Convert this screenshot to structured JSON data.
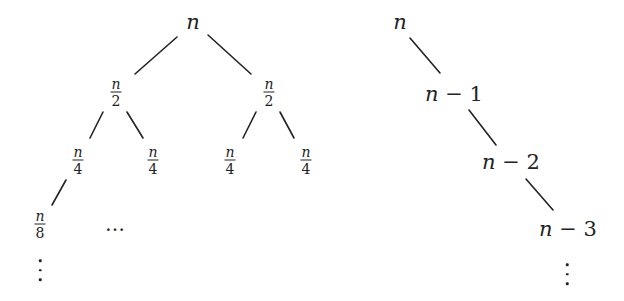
{
  "left_tree": {
    "root": {
      "label": "n"
    },
    "level1": [
      {
        "num": "n",
        "den": "2"
      },
      {
        "num": "n",
        "den": "2"
      }
    ],
    "level2": [
      {
        "num": "n",
        "den": "4"
      },
      {
        "num": "n",
        "den": "4"
      },
      {
        "num": "n",
        "den": "4"
      },
      {
        "num": "n",
        "den": "4"
      }
    ],
    "level3": {
      "num": "n",
      "den": "8"
    },
    "hdots": "…"
  },
  "right_chain": {
    "nodes": [
      {
        "var": "n",
        "rest": ""
      },
      {
        "var": "n",
        "rest": " − 1"
      },
      {
        "var": "n",
        "rest": " − 2"
      },
      {
        "var": "n",
        "rest": " − 3"
      }
    ]
  },
  "colors": {
    "ink": "#222222",
    "background": "#ffffff"
  }
}
